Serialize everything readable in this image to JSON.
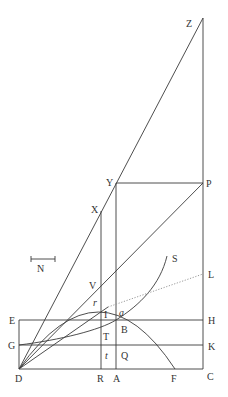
{
  "figure": {
    "type": "geometric-diagram",
    "colors": {
      "line": "#3a3a3a",
      "dotted": "#9a9a9a",
      "text": "#333333",
      "background": "#ffffff"
    },
    "labels": {
      "Z": "Z",
      "Y": "Y",
      "P": "P",
      "X": "X",
      "N": "N",
      "S": "S",
      "V": "V",
      "L": "L",
      "r": "r",
      "a": "a",
      "I": "I",
      "E": "E",
      "H": "H",
      "B": "B",
      "T": "T",
      "G": "G",
      "K": "K",
      "t": "t",
      "Q": "Q",
      "D": "D",
      "R": "R",
      "A": "A",
      "F": "F",
      "C": "C"
    },
    "points": {
      "D": [
        19,
        369
      ],
      "C": [
        203,
        369
      ],
      "Z": [
        203,
        18
      ],
      "P": [
        203,
        183
      ],
      "Y": [
        116,
        183
      ],
      "X": [
        101,
        211
      ],
      "A": [
        116,
        369
      ],
      "R": [
        101,
        369
      ],
      "F": [
        175,
        369
      ],
      "E": [
        19,
        320
      ],
      "H": [
        203,
        320
      ],
      "G": [
        19,
        345
      ],
      "K": [
        203,
        345
      ],
      "L": [
        203,
        274
      ],
      "S": [
        167,
        256
      ],
      "B": [
        116,
        320
      ]
    }
  }
}
